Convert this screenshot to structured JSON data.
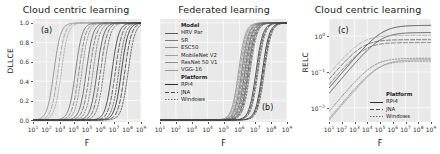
{
  "figure": {
    "background": "#ffffff",
    "axes_facecolor": "#e9e9e9",
    "grid_color": "#ffffff"
  },
  "panels": [
    {
      "letter": "(a)",
      "title": "Cloud centric learning",
      "xlabel": "F",
      "ylabel": "DLLCE"
    },
    {
      "letter": "(b)",
      "title": "Federated learning",
      "xlabel": "F",
      "ylabel": ""
    },
    {
      "letter": "(c)",
      "title": "Cloud centric learning",
      "xlabel": "F",
      "ylabel": "RELC"
    }
  ],
  "legend_b": {
    "groups": [
      {
        "header": "Model",
        "entries": [
          {
            "label": "HRV Par",
            "color": "#5a5a5a",
            "dash": "none"
          },
          {
            "label": "SR",
            "color": "#7a7a7a",
            "dash": "none"
          },
          {
            "label": "ESC50",
            "color": "#8f8f8f",
            "dash": "none"
          },
          {
            "label": "MobileNet V2",
            "color": "#a0a0a0",
            "dash": "none"
          },
          {
            "label": "ResNet 50 V1",
            "color": "#8a8a8a",
            "dash": "none"
          },
          {
            "label": "VGG-16",
            "color": "#9c9c9c",
            "dash": "none"
          }
        ]
      },
      {
        "header": "Platform",
        "entries": [
          {
            "label": "RPi4",
            "color": "#2e2e2e",
            "dash": "none"
          },
          {
            "label": "JNA",
            "color": "#4a4a4a",
            "dash": "4,2"
          },
          {
            "label": "Windows",
            "color": "#6e6e6e",
            "dash": "1.5,1.5"
          }
        ]
      }
    ]
  },
  "legend_c": {
    "header": "Platform",
    "entries": [
      {
        "label": "RPi4",
        "color": "#2e2e2e",
        "dash": "none"
      },
      {
        "label": "JNA",
        "color": "#4a4a4a",
        "dash": "4,2"
      },
      {
        "label": "Windows",
        "color": "#6e6e6e",
        "dash": "1.5,1.5"
      }
    ]
  },
  "chart_data": [
    {
      "type": "line",
      "panel": "(a)",
      "title": "Cloud centric learning",
      "xlabel": "F",
      "ylabel": "DLLCE",
      "xscale": "log",
      "yscale": "linear",
      "xlim": [
        10,
        1000000000
      ],
      "ylim": [
        -0.02,
        1.04
      ],
      "xticks": [
        "10^1",
        "10^2",
        "10^3",
        "10^4",
        "10^5",
        "10^6",
        "10^7",
        "10^8",
        "10^9"
      ],
      "yticks": [
        "0.0",
        "0.2",
        "0.4",
        "0.6",
        "0.8",
        "1.0"
      ],
      "grid": true,
      "legend": "none",
      "note": "Sigmoid (logistic) curves in log10(F); each curve defined by midpoint log10(F50) and slope.",
      "series": [
        {
          "name": "HRV Par / RPi4",
          "color": "#8a8a8a",
          "dash": "none",
          "midpoint_log10F": 2.55,
          "slope": 1.75
        },
        {
          "name": "HRV Par / JNA",
          "color": "#9a9a9a",
          "dash": "4,2",
          "midpoint_log10F": 2.85,
          "slope": 1.75
        },
        {
          "name": "HRV Par / Windows",
          "color": "#a6a6a6",
          "dash": "1.5,1.5",
          "midpoint_log10F": 3.1,
          "slope": 1.75
        },
        {
          "name": "SR / RPi4",
          "color": "#6f6f6f",
          "dash": "none",
          "midpoint_log10F": 4.15,
          "slope": 1.75
        },
        {
          "name": "SR / JNA",
          "color": "#808080",
          "dash": "4,2",
          "midpoint_log10F": 4.4,
          "slope": 1.75
        },
        {
          "name": "SR / Windows",
          "color": "#8c8c8c",
          "dash": "1.5,1.5",
          "midpoint_log10F": 4.62,
          "slope": 1.75
        },
        {
          "name": "ESC50 / RPi4",
          "color": "#5e5e5e",
          "dash": "none",
          "midpoint_log10F": 4.95,
          "slope": 1.75
        },
        {
          "name": "ESC50 / JNA",
          "color": "#707070",
          "dash": "4,2",
          "midpoint_log10F": 5.2,
          "slope": 1.75
        },
        {
          "name": "ESC50 / Windows",
          "color": "#7c7c7c",
          "dash": "1.5,1.5",
          "midpoint_log10F": 5.45,
          "slope": 1.75
        },
        {
          "name": "MobileNet V2 / RPi4",
          "color": "#4d4d4d",
          "dash": "none",
          "midpoint_log10F": 5.75,
          "slope": 1.75
        },
        {
          "name": "MobileNet V2 / JNA",
          "color": "#606060",
          "dash": "4,2",
          "midpoint_log10F": 6.0,
          "slope": 1.75
        },
        {
          "name": "MobileNet V2 / Win",
          "color": "#6d6d6d",
          "dash": "1.5,1.5",
          "midpoint_log10F": 6.25,
          "slope": 1.75
        },
        {
          "name": "ResNet 50 V1 / RPi4",
          "color": "#3a3a3a",
          "dash": "none",
          "midpoint_log10F": 6.85,
          "slope": 1.75
        },
        {
          "name": "ResNet 50 V1 / JNA",
          "color": "#4f4f4f",
          "dash": "4,2",
          "midpoint_log10F": 7.1,
          "slope": 1.75
        },
        {
          "name": "ResNet 50 V1 / Win",
          "color": "#5c5c5c",
          "dash": "1.5,1.5",
          "midpoint_log10F": 7.35,
          "slope": 1.75
        },
        {
          "name": "VGG-16 / RPi4",
          "color": "#2b2b2b",
          "dash": "none",
          "midpoint_log10F": 7.55,
          "slope": 1.75
        },
        {
          "name": "VGG-16 / JNA",
          "color": "#414141",
          "dash": "4,2",
          "midpoint_log10F": 7.8,
          "slope": 1.75
        },
        {
          "name": "VGG-16 / Windows",
          "color": "#525252",
          "dash": "1.5,1.5",
          "midpoint_log10F": 8.05,
          "slope": 1.75
        }
      ]
    },
    {
      "type": "line",
      "panel": "(b)",
      "title": "Federated learning",
      "xlabel": "F",
      "ylabel": "",
      "xscale": "log",
      "yscale": "linear",
      "xlim": [
        10,
        1000000000
      ],
      "ylim": [
        -0.02,
        1.04
      ],
      "xticks": [
        "10^1",
        "10^2",
        "10^3",
        "10^4",
        "10^5",
        "10^6",
        "10^7",
        "10^8",
        "10^9"
      ],
      "yticks": [],
      "grid": true,
      "legend": "upper left",
      "note": "Curves cluster tightly; federated learning curves shifted right and overlapping.",
      "series": [
        {
          "name": "HRV Par / RPi4",
          "color": "#8a8a8a",
          "dash": "none",
          "midpoint_log10F": 5.95,
          "slope": 2.0
        },
        {
          "name": "HRV Par / JNA",
          "color": "#9a9a9a",
          "dash": "4,2",
          "midpoint_log10F": 6.02,
          "slope": 2.0
        },
        {
          "name": "HRV Par / Windows",
          "color": "#a6a6a6",
          "dash": "1.5,1.5",
          "midpoint_log10F": 6.08,
          "slope": 2.0
        },
        {
          "name": "SR / RPi4",
          "color": "#6f6f6f",
          "dash": "none",
          "midpoint_log10F": 6.15,
          "slope": 2.0
        },
        {
          "name": "SR / JNA",
          "color": "#808080",
          "dash": "4,2",
          "midpoint_log10F": 6.22,
          "slope": 2.0
        },
        {
          "name": "SR / Windows",
          "color": "#8c8c8c",
          "dash": "1.5,1.5",
          "midpoint_log10F": 6.28,
          "slope": 2.0
        },
        {
          "name": "ESC50 / RPi4",
          "color": "#5e5e5e",
          "dash": "none",
          "midpoint_log10F": 6.35,
          "slope": 2.0
        },
        {
          "name": "ESC50 / JNA",
          "color": "#707070",
          "dash": "4,2",
          "midpoint_log10F": 6.42,
          "slope": 2.0
        },
        {
          "name": "ESC50 / Windows",
          "color": "#7c7c7c",
          "dash": "1.5,1.5",
          "midpoint_log10F": 6.48,
          "slope": 2.0
        },
        {
          "name": "MobileNet V2 / RPi4",
          "color": "#4d4d4d",
          "dash": "none",
          "midpoint_log10F": 6.55,
          "slope": 2.0
        },
        {
          "name": "MobileNet V2 / JNA",
          "color": "#606060",
          "dash": "4,2",
          "midpoint_log10F": 6.62,
          "slope": 2.0
        },
        {
          "name": "MobileNet V2 / Win",
          "color": "#6d6d6d",
          "dash": "1.5,1.5",
          "midpoint_log10F": 6.68,
          "slope": 2.0
        },
        {
          "name": "ResNet 50 V1 / RPi4",
          "color": "#3a3a3a",
          "dash": "none",
          "midpoint_log10F": 7.05,
          "slope": 2.0
        },
        {
          "name": "ResNet 50 V1 / JNA",
          "color": "#4f4f4f",
          "dash": "4,2",
          "midpoint_log10F": 7.12,
          "slope": 2.0
        },
        {
          "name": "ResNet 50 V1 / Win",
          "color": "#5c5c5c",
          "dash": "1.5,1.5",
          "midpoint_log10F": 7.18,
          "slope": 2.0
        },
        {
          "name": "VGG-16 / RPi4",
          "color": "#2b2b2b",
          "dash": "none",
          "midpoint_log10F": 7.45,
          "slope": 2.0
        },
        {
          "name": "VGG-16 / JNA",
          "color": "#414141",
          "dash": "4,2",
          "midpoint_log10F": 7.52,
          "slope": 2.0
        },
        {
          "name": "VGG-16 / Windows",
          "color": "#525252",
          "dash": "1.5,1.5",
          "midpoint_log10F": 7.58,
          "slope": 2.0
        }
      ]
    },
    {
      "type": "line",
      "panel": "(c)",
      "title": "Cloud centric learning",
      "xlabel": "F",
      "ylabel": "RELC",
      "xscale": "log",
      "yscale": "log",
      "xlim": [
        10,
        1000000000
      ],
      "ylim": [
        0.004,
        3.0
      ],
      "xticks": [
        "10^1",
        "10^2",
        "10^3",
        "10^4",
        "10^5",
        "10^6",
        "10^7",
        "10^8",
        "10^9"
      ],
      "yticks": [
        "10^0",
        "10^-1",
        "10^-2"
      ],
      "grid": true,
      "legend": "lower right",
      "note": "Saturating curves rising from lower-left then flattening to per-series plateaus.",
      "series": [
        {
          "name": "RPi4 / s1",
          "color": "#3a3a3a",
          "dash": "none",
          "start_log10y": -1.45,
          "plateau_log10y": 0.3,
          "knee_log10F": 6.2
        },
        {
          "name": "RPi4 / s2",
          "color": "#4a4a4a",
          "dash": "none",
          "start_log10y": -1.6,
          "plateau_log10y": 0.1,
          "knee_log10F": 6.3
        },
        {
          "name": "JNA / s1",
          "color": "#5a5a5a",
          "dash": "4,2",
          "start_log10y": -1.2,
          "plateau_log10y": -0.1,
          "knee_log10F": 5.8
        },
        {
          "name": "JNA / s2",
          "color": "#6a6a6a",
          "dash": "4,2",
          "start_log10y": -1.35,
          "plateau_log10y": -0.18,
          "knee_log10F": 5.9
        },
        {
          "name": "Windows / s1",
          "color": "#7a7a7a",
          "dash": "1.5,1.5",
          "start_log10y": -2.1,
          "plateau_log10y": -0.62,
          "knee_log10F": 6.6
        },
        {
          "name": "Windows / s2",
          "color": "#8a8a8a",
          "dash": "1.5,1.5",
          "start_log10y": -2.3,
          "plateau_log10y": -0.7,
          "knee_log10F": 6.7
        },
        {
          "name": "low / s1",
          "color": "#9a9a9a",
          "dash": "none",
          "start_log10y": -2.35,
          "plateau_log10y": -0.66,
          "knee_log10F": 6.8
        },
        {
          "name": "low / s2",
          "color": "#a4a4a4",
          "dash": "4,2",
          "start_log10y": -1.05,
          "plateau_log10y": 0.02,
          "knee_log10F": 5.6
        }
      ]
    }
  ]
}
